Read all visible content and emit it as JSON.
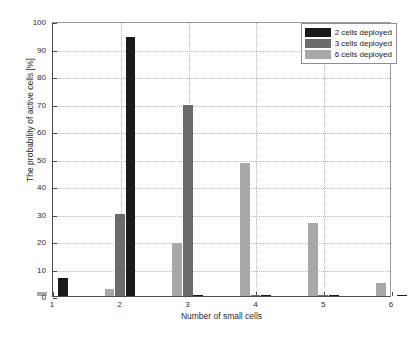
{
  "chart_data": {
    "type": "bar",
    "title": "",
    "xlabel": "Number of small cells",
    "ylabel": "The probability of active cells [%]",
    "categories": [
      "1",
      "2",
      "3",
      "4",
      "5",
      "6"
    ],
    "xlim": [
      1,
      6
    ],
    "ylim": [
      0,
      100
    ],
    "ytick_labels": [
      "0",
      "10",
      "20",
      "30",
      "40",
      "50",
      "60",
      "70",
      "80",
      "90",
      "100"
    ],
    "xtick_labels": [
      "1",
      "2",
      "3",
      "4",
      "5",
      "6"
    ],
    "grid": true,
    "legend_position": "top-right",
    "series": [
      {
        "name": "2 cells deployed",
        "color": "#1a1a1a",
        "values": [
          6.5,
          94.2,
          0.4,
          0.4,
          0.4,
          0.2
        ]
      },
      {
        "name": "3 cells deployed",
        "color": "#6b6b6b",
        "values": [
          0,
          30.0,
          69.5,
          0.3,
          0.2,
          0
        ]
      },
      {
        "name": "6 cells deployed",
        "color": "#a8a8a8",
        "values": [
          1.3,
          2.6,
          19.1,
          48.5,
          26.5,
          4.7
        ]
      }
    ]
  },
  "legend": {
    "items": [
      {
        "label": "2 cells deployed",
        "color": "#1a1a1a"
      },
      {
        "label": "3 cells deployed",
        "color": "#6b6b6b"
      },
      {
        "label": "6 cells deployed",
        "color": "#a8a8a8"
      }
    ]
  }
}
